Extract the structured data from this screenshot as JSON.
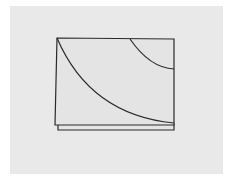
{
  "diagram": {
    "background_color": "#ffffff",
    "panel_color": "#e9e9e9",
    "sheet_fill": "#e4e4e4",
    "stroke_color": "#2a2a2a",
    "panel": {
      "x": 10,
      "y": 6,
      "w": 213,
      "h": 168
    },
    "back_sheet": {
      "points": "58,130 174,130 174,124 58,124"
    },
    "front_sheet": {
      "points": "57,38 174,39 174,125 55,125"
    },
    "large_curve": {
      "d": "M57,38 Q90,115 174,123"
    },
    "small_curve": {
      "d": "M130,39 Q150,68 174,69"
    }
  }
}
